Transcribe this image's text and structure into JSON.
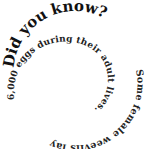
{
  "spiral": {
    "heading": "Did you know?",
    "line_outer": " Some female weevils lay",
    "line_inner": "6,000 eggs during their adult lives.",
    "full_text": "Did you know? Some female weevils lay 6,000 eggs during their adult lives.",
    "text_color": "#111111",
    "background": "#ffffff"
  }
}
